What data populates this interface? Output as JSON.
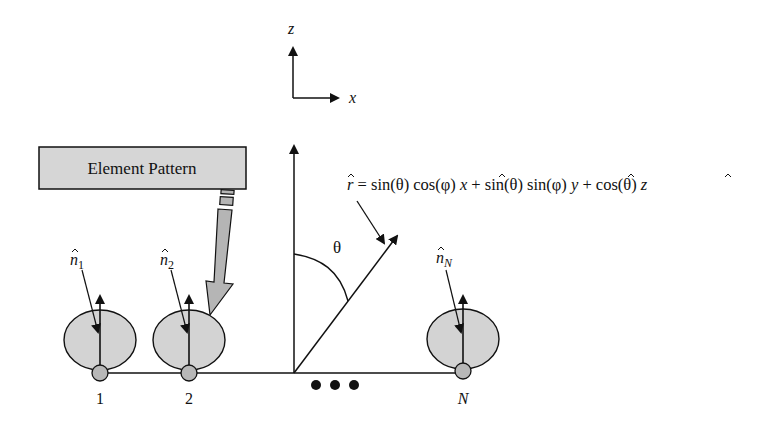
{
  "axes_legend": {
    "z_label": "z",
    "x_label": "x"
  },
  "element_pattern_box": {
    "label": "Element Pattern"
  },
  "direction_vector": {
    "r_hat": "r",
    "equation_rest": " = sin(θ) cos(φ) ",
    "x_hat": "x",
    "plus1": " + sin(θ) sin(φ) ",
    "y_hat": "y",
    "plus2": " + cos(θ) ",
    "z_hat": "z"
  },
  "angle_label": "θ",
  "elements": [
    {
      "index_label": "1",
      "normal_label": "n",
      "normal_sub": "1"
    },
    {
      "index_label": "2",
      "normal_label": "n",
      "normal_sub": "2"
    },
    {
      "index_label": "N",
      "normal_label": "n",
      "normal_sub": "N"
    }
  ],
  "ellipsis": "• • •",
  "colors": {
    "pattern_fill": "#d3d3d3",
    "node_fill": "#b8b8b8",
    "box_fill": "#d6d6d6",
    "stroke": "#111111"
  }
}
